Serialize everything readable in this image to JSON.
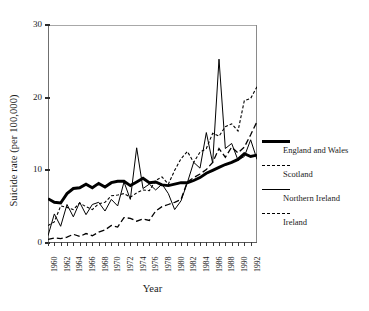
{
  "chart_data": {
    "type": "line",
    "title": "",
    "xlabel": "Year",
    "ylabel": "Suicide rate (per 100,000)",
    "xlim": [
      1960,
      1993
    ],
    "ylim": [
      0,
      30
    ],
    "yticks": [
      0,
      10,
      20,
      30
    ],
    "grid": false,
    "legend_position": "right",
    "xtick_labels": [
      "1960",
      "1962",
      "1964",
      "1966",
      "1968",
      "1970",
      "1972",
      "1974",
      "1976",
      "1978",
      "1980",
      "1982",
      "1984",
      "1986",
      "1988",
      "1990",
      "1992"
    ],
    "x": [
      1960,
      1961,
      1962,
      1963,
      1964,
      1965,
      1966,
      1967,
      1968,
      1969,
      1970,
      1971,
      1972,
      1973,
      1974,
      1975,
      1976,
      1977,
      1978,
      1979,
      1980,
      1981,
      1982,
      1983,
      1984,
      1985,
      1986,
      1987,
      1988,
      1989,
      1990,
      1991,
      1992,
      1993
    ],
    "series": [
      {
        "name": "England and Wales",
        "style": "thick-solid",
        "color": "#000000",
        "values": [
          6.1,
          5.6,
          5.5,
          6.8,
          7.5,
          7.6,
          8.1,
          7.6,
          8.2,
          7.7,
          8.3,
          8.5,
          8.5,
          7.9,
          8.4,
          8.9,
          8.3,
          8.4,
          8.0,
          7.9,
          8.1,
          8.3,
          8.3,
          8.6,
          9.0,
          9.6,
          10.0,
          10.4,
          10.8,
          11.1,
          11.5,
          12.3,
          11.9,
          12.1
        ]
      },
      {
        "name": "Scotland",
        "style": "fine-dash",
        "color": "#000000",
        "values": [
          2.4,
          2.9,
          5.1,
          4.9,
          4.6,
          5.5,
          5.0,
          4.6,
          5.4,
          5.6,
          6.5,
          6.6,
          6.8,
          6.3,
          6.9,
          7.3,
          7.2,
          8.6,
          9.1,
          8.1,
          10.0,
          11.6,
          12.6,
          11.1,
          12.5,
          13.0,
          15.1,
          14.7,
          16.0,
          16.4,
          15.4,
          19.6,
          19.9,
          21.5
        ]
      },
      {
        "name": "Northern Ireland",
        "style": "thin-solid",
        "color": "#000000",
        "values": [
          1.0,
          4.0,
          2.3,
          5.3,
          3.6,
          5.6,
          3.9,
          5.3,
          5.6,
          4.4,
          6.0,
          5.1,
          8.4,
          6.0,
          13.1,
          7.5,
          8.1,
          7.3,
          8.1,
          6.8,
          4.6,
          5.8,
          8.3,
          11.1,
          10.3,
          15.2,
          11.0,
          25.3,
          13.0,
          13.7,
          11.4,
          11.9,
          14.2,
          11.5
        ]
      },
      {
        "name": "Ireland",
        "style": "long-dash",
        "color": "#000000",
        "values": [
          0.5,
          0.7,
          0.6,
          0.8,
          1.2,
          0.9,
          1.3,
          1.0,
          1.5,
          1.8,
          2.4,
          2.2,
          3.5,
          3.4,
          3.0,
          3.3,
          3.1,
          4.4,
          5.0,
          5.3,
          5.6,
          6.0,
          8.4,
          9.0,
          9.5,
          10.1,
          11.1,
          13.0,
          11.8,
          13.2,
          12.4,
          13.2,
          14.9,
          16.7
        ]
      }
    ]
  }
}
